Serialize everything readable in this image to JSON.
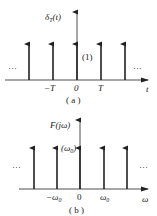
{
  "figures": [
    {
      "id": "a",
      "caption": "( a )",
      "y_label_main": "δ",
      "y_label_sub": "T",
      "y_label_arg": "(t)",
      "x_label": "t",
      "impulse_weight": "(1)",
      "ticks": [
        "−T",
        "0",
        "T"
      ],
      "ellipsis": "···",
      "impulse_count": 5
    },
    {
      "id": "b",
      "caption": "( b )",
      "y_label": "F(jω)",
      "x_label": "ω",
      "impulse_weight_main": "(ω",
      "impulse_weight_sub": "0",
      "impulse_weight_close": ")",
      "ticks": [
        {
          "main": "−ω",
          "sub": "0"
        },
        {
          "main": "0",
          "sub": ""
        },
        {
          "main": "ω",
          "sub": "0"
        }
      ],
      "ellipsis": "···",
      "impulse_count": 5
    }
  ]
}
